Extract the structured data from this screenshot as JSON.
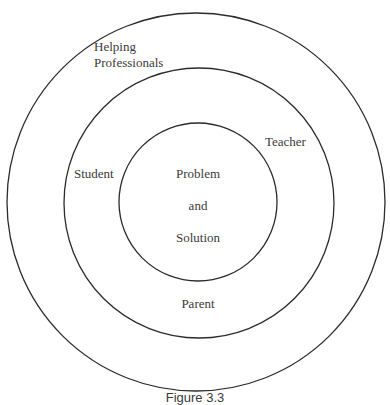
{
  "diagram": {
    "type": "concentric-circles",
    "rings": [
      {
        "label_lines": [
          "Helping",
          "Professionals"
        ]
      },
      {
        "labels": [
          "Teacher",
          "Student",
          "Parent"
        ]
      },
      {
        "label_lines": [
          "Problem",
          "and",
          "Solution"
        ]
      }
    ],
    "outer": {
      "line1": "Helping",
      "line2": "Professionals"
    },
    "middle": {
      "teacher": "Teacher",
      "student": "Student",
      "parent": "Parent"
    },
    "inner": {
      "line1": "Problem",
      "line2": "and",
      "line3": "Solution"
    },
    "caption": "Figure 3.3",
    "stroke_color": "#2b2b2b",
    "text_color": "#3a3a3a"
  }
}
